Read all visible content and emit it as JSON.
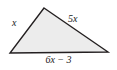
{
  "figure": {
    "kind": "geometry-diagram",
    "shape": "triangle",
    "background_color": "#ffffff",
    "fill_color": "#ececec",
    "stroke_color": "#231f20",
    "stroke_width": 1.4,
    "vertices": {
      "apex": [
        44,
        8
      ],
      "left": [
        10,
        53
      ],
      "right": [
        108,
        52
      ]
    },
    "labels": {
      "left_side": "x",
      "right_side": "5x",
      "bottom_side": "6x − 3"
    }
  }
}
